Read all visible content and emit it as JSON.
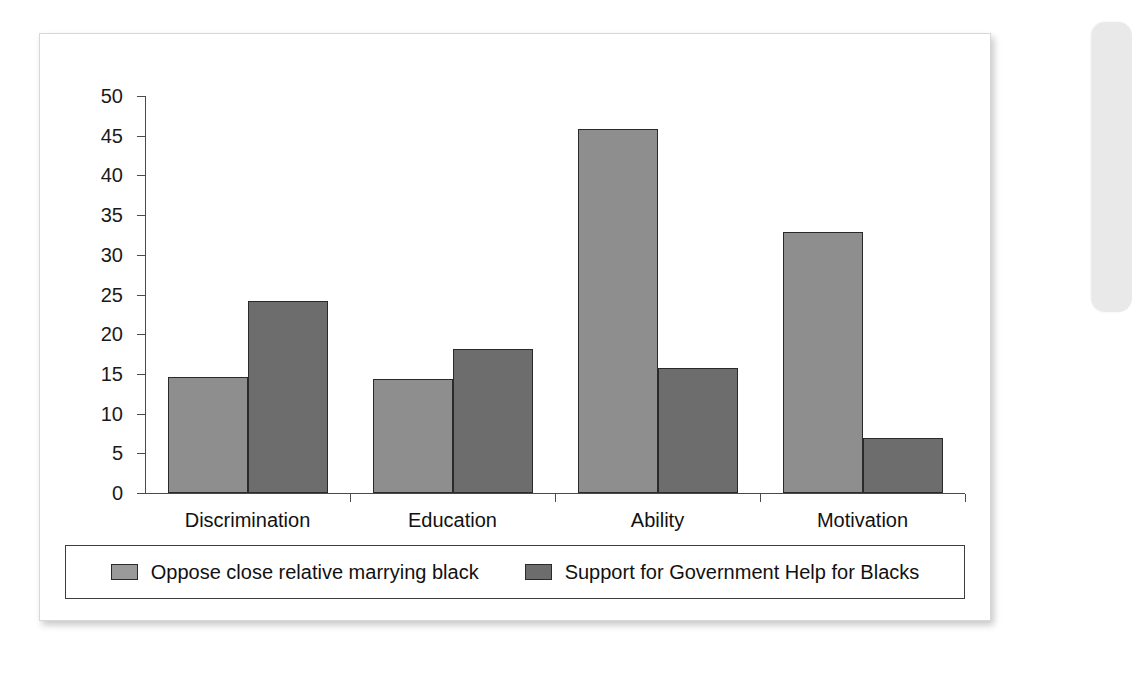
{
  "chart_data": {
    "type": "bar",
    "title": "",
    "subtitle": "",
    "xlabel": "",
    "ylabel": "",
    "categories": [
      "Discrimination",
      "Education",
      "Ability",
      "Motivation"
    ],
    "series": [
      {
        "name": "Oppose close relative marrying black",
        "color": "#8e8e8e",
        "values": [
          14.6,
          14.3,
          45.8,
          32.9
        ]
      },
      {
        "name": "Support for Government Help for Blacks",
        "color": "#6d6d6d",
        "values": [
          24.2,
          18.1,
          15.7,
          6.9
        ]
      }
    ],
    "ylim": [
      0,
      50
    ],
    "ytick_step": 5,
    "ytick_labels": [
      "50",
      "45",
      "40",
      "35",
      "30",
      "25",
      "20",
      "15",
      "10",
      "5",
      "0"
    ],
    "grid": false,
    "legend_position": "bottom",
    "legend_boxed": true,
    "annotations": []
  },
  "legend": {
    "entries": [
      {
        "label": "Oppose close relative marrying black",
        "swatch": "legend-swatch-series-1"
      },
      {
        "label": "Support for Government Help for Blacks",
        "swatch": "legend-swatch-series-2"
      }
    ]
  },
  "colors": {
    "series_1": "#8e8e8e",
    "series_2": "#6d6d6d",
    "axis": "#4a4a4a",
    "bar_outline": "#2a2a2a",
    "card_background": "#ffffff",
    "page_background": "#ffffff"
  }
}
